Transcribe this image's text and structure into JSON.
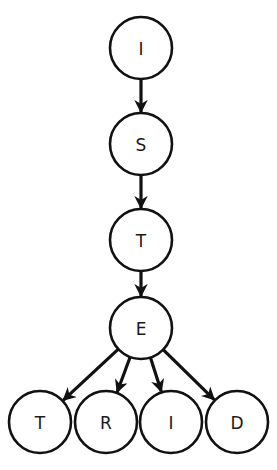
{
  "diagram": {
    "type": "tree",
    "colors": {
      "stroke": "#111111",
      "fill": "#ffffff",
      "text": "#1a1a1a"
    },
    "nodes": [
      {
        "id": "n1",
        "label": "I",
        "x": 141,
        "y": 48
      },
      {
        "id": "n2",
        "label": "S",
        "x": 141,
        "y": 144
      },
      {
        "id": "n3",
        "label": "T",
        "x": 141,
        "y": 240
      },
      {
        "id": "n4",
        "label": "E",
        "x": 141,
        "y": 328
      },
      {
        "id": "n5",
        "label": "T",
        "x": 40,
        "y": 422
      },
      {
        "id": "n6",
        "label": "R",
        "x": 106,
        "y": 422
      },
      {
        "id": "n7",
        "label": "I",
        "x": 171,
        "y": 422
      },
      {
        "id": "n8",
        "label": "D",
        "x": 237,
        "y": 422
      }
    ],
    "edges": [
      {
        "from": "n1",
        "to": "n2"
      },
      {
        "from": "n2",
        "to": "n3"
      },
      {
        "from": "n3",
        "to": "n4"
      },
      {
        "from": "n4",
        "to": "n5"
      },
      {
        "from": "n4",
        "to": "n6"
      },
      {
        "from": "n4",
        "to": "n7"
      },
      {
        "from": "n4",
        "to": "n8"
      }
    ],
    "node_radius": 31
  }
}
